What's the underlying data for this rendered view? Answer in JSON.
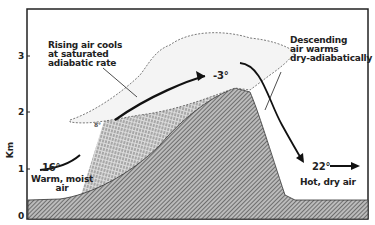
{
  "axis": {
    "ylabel": "Km",
    "ticks": [
      "0",
      "1",
      "2",
      "3"
    ]
  },
  "annotations": {
    "rising": [
      "Rising air cools",
      "at saturated",
      "adiabatic rate"
    ],
    "descending": [
      "Descending",
      "air warms",
      "dry-adiabatically"
    ],
    "warm_moist": [
      "Warm, moist",
      "air"
    ],
    "hot_dry": "Hot, dry air"
  },
  "temperatures": {
    "start": "16°",
    "cloud_base": "8°",
    "summit": "-3°",
    "end": "22°"
  },
  "colors": {
    "ink": "#222222",
    "background": "#ffffff",
    "hatch": "#555555"
  }
}
